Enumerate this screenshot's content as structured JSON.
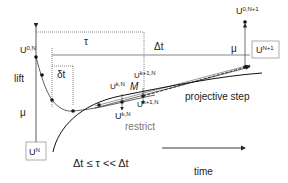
{
  "diagram": {
    "labels": {
      "u0N": "U",
      "u0N_sup": "0,N",
      "tau": "τ",
      "delta_t": "Δt",
      "small_delta_t": "δt",
      "lift": "lift",
      "mu_left": "μ",
      "mu_right": "μ",
      "ukN_top": "U",
      "ukN_top_sup": "k,N",
      "uk1N_top": "U",
      "uk1N_top_sup": "k+1,N",
      "M": "M",
      "ukN_bottom": "U",
      "ukN_bottom_sup": "k,N",
      "uk1N_bottom": "U",
      "uk1N_bottom_sup": "k+1,N",
      "restrict": "restrict",
      "projective_step": "projective step",
      "u0N1": "U",
      "u0N1_sup": "0,N+1",
      "uN1_box": "U",
      "uN1_box_sup": "N+1",
      "uN_box": "U",
      "uN_box_sup": "N",
      "inequality": "Δt ≤ τ << Δt",
      "time": "time"
    },
    "colors": {
      "line": "#222222",
      "restrict_text": "#777777",
      "box_border": "#999999"
    }
  }
}
